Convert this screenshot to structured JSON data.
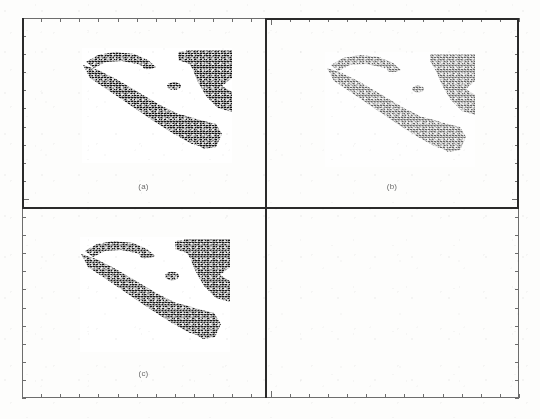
{
  "figure": {
    "kind": "scanned-multipanel-figure",
    "panel_count": 4,
    "occupied_panels": 3,
    "background_color": "#fdfdfc",
    "ink_color": "#2a2a2a",
    "axis_color": "#6d6d6d"
  },
  "frame": {
    "name": "tick-frame",
    "top_ticks": 26,
    "bottom_ticks": 26,
    "left_ticks": 21,
    "right_ticks": 21,
    "long_tick_index_x": 13,
    "long_tick_index_y": 10
  },
  "panels": [
    {
      "id": "a",
      "caption": "(a)",
      "position": "top-left",
      "has_image": true,
      "image_name": "coastline-raster-a",
      "tone": "dense",
      "description": "binary thresholded satellite raster of a coastline"
    },
    {
      "id": "b",
      "caption": "(b)",
      "position": "top-right",
      "has_image": true,
      "image_name": "coastline-raster-b",
      "tone": "light",
      "description": "binary thresholded satellite raster of a coastline"
    },
    {
      "id": "c",
      "caption": "(c)",
      "position": "bottom-left",
      "has_image": true,
      "image_name": "coastline-raster-c",
      "tone": "dense",
      "description": "binary thresholded satellite raster of a coastline"
    },
    {
      "id": "d",
      "caption": "",
      "position": "bottom-right",
      "has_image": false,
      "image_name": "",
      "tone": "empty",
      "description": "empty quadrant"
    }
  ]
}
